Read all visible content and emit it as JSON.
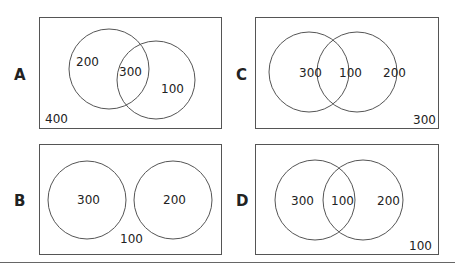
{
  "panels": [
    {
      "label": "A",
      "left_only": "200",
      "both": "300",
      "right_only": "100",
      "outside": "400"
    },
    {
      "label": "B",
      "left_only": "300",
      "right_only": "200",
      "outside": "100"
    },
    {
      "label": "C",
      "left_only": "300",
      "both": "100",
      "right_only": "200",
      "outside": "300"
    },
    {
      "label": "D",
      "left_only": "300",
      "both": "100",
      "right_only": "200",
      "outside": "100"
    }
  ]
}
